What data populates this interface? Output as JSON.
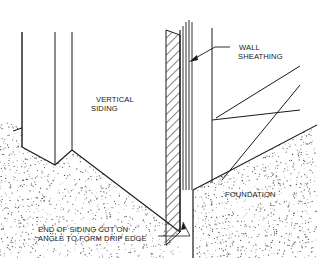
{
  "labels": {
    "vertical_siding": [
      "VERTICAL",
      "SIDING"
    ],
    "wall_sheathing": [
      "WALL",
      "SHEATHING"
    ],
    "foundation": "FOUNDATION",
    "drip_edge_note": [
      "END OF SIDING CUT ON",
      "ANGLE TO FORM DRIP EDGE"
    ]
  },
  "colors": {
    "ink": "#1a1a1a",
    "background": "#ffffff",
    "stipple": "#555555"
  }
}
